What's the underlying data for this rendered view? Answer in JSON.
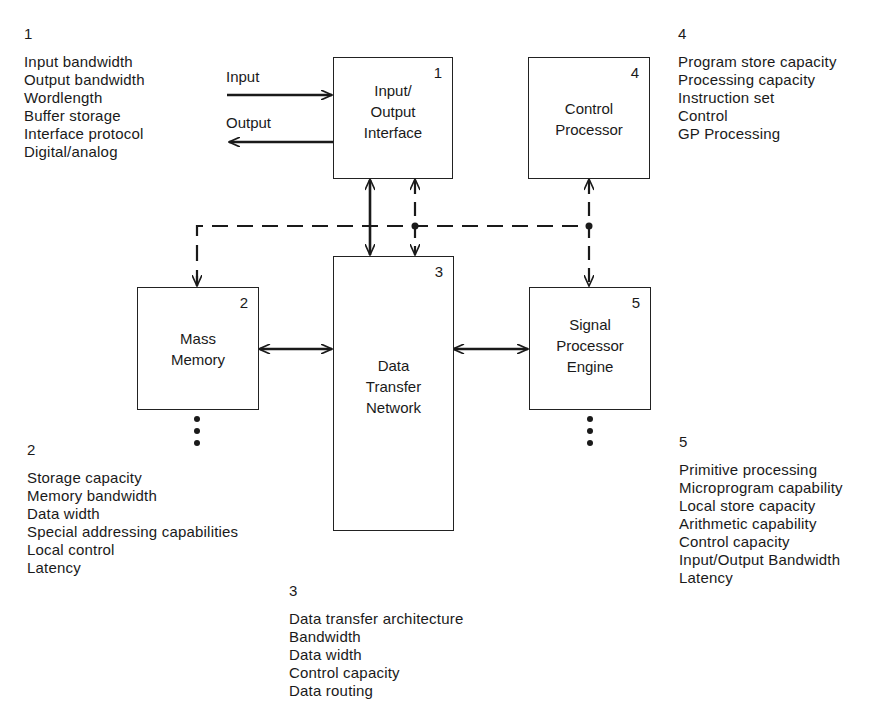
{
  "blocks": [
    {
      "id": 1,
      "number": "1",
      "title_lines": [
        "Input/",
        "Output",
        "Interface"
      ]
    },
    {
      "id": 2,
      "number": "2",
      "title_lines": [
        "Mass",
        "Memory"
      ]
    },
    {
      "id": 3,
      "number": "3",
      "title_lines": [
        "Data",
        "Transfer",
        "Network"
      ]
    },
    {
      "id": 4,
      "number": "4",
      "title_lines": [
        "Control",
        "Processor"
      ]
    },
    {
      "id": 5,
      "number": "5",
      "title_lines": [
        "Signal",
        "Processor",
        "Engine"
      ]
    }
  ],
  "external_io": {
    "input_label": "Input",
    "output_label": "Output"
  },
  "attributes": {
    "block1": {
      "number": "1",
      "items": [
        "Input bandwidth",
        "Output bandwidth",
        "Wordlength",
        "Buffer storage",
        "Interface protocol",
        "Digital/analog"
      ]
    },
    "block2": {
      "number": "2",
      "items": [
        "Storage capacity",
        "Memory bandwidth",
        "Data width",
        "Special addressing capabilities",
        "Local control",
        "Latency"
      ]
    },
    "block3": {
      "number": "3",
      "items": [
        "Data transfer architecture",
        "Bandwidth",
        "Data width",
        "Control capacity",
        "Data routing"
      ]
    },
    "block4": {
      "number": "4",
      "items": [
        "Program store capacity",
        "Processing capacity",
        "Instruction set",
        "Control",
        "GP Processing"
      ]
    },
    "block5": {
      "number": "5",
      "items": [
        "Primitive processing",
        "Microprogram capability",
        "Local store capacity",
        "Arithmetic capability",
        "Control capacity",
        "Input/Output Bandwidth",
        "Latency"
      ]
    }
  },
  "colors": {
    "ink": "#1a1a1a",
    "background": "#ffffff"
  }
}
